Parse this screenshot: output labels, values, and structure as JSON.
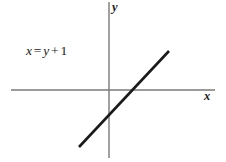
{
  "figure": {
    "type": "line-graph",
    "background_color": "#ffffff",
    "equation_label": {
      "full_text": "x = y + 1",
      "lhs": "x",
      "equals": "=",
      "rhs_var": "y",
      "plus": "+",
      "constant": "1"
    },
    "axes": {
      "x_label": "x",
      "y_label": "y",
      "axis_color": "#7a7a7a"
    },
    "line": {
      "color": "#1a1a1a"
    }
  },
  "chart_data": {
    "type": "line",
    "title": "",
    "subtitle": "",
    "xlabel": "x",
    "ylabel": "y",
    "annotations": [
      "x = y + 1"
    ],
    "legend": [],
    "grid": false,
    "axis_origin_px": {
      "x": 109,
      "y": 90
    },
    "xlim": [
      -4.9,
      5.3
    ],
    "ylim": [
      -3.4,
      4.4
    ],
    "series": [
      {
        "name": "x = y + 1",
        "equation": "x = y + 1",
        "slope": 1,
        "y_intercept": -1,
        "x_intercept": 1,
        "points": [
          {
            "x": -1.5,
            "y": -2.5
          },
          {
            "x": 3.0,
            "y": 2.0
          }
        ],
        "endpoints_px": [
          {
            "x": 79,
            "y": 147
          },
          {
            "x": 169,
            "y": 51
          }
        ],
        "color": "#1a1a1a",
        "width_px": 2.6
      }
    ],
    "x_axis_px": {
      "x1": 11,
      "y1": 90,
      "x2": 215,
      "y2": 90
    },
    "y_axis_px": {
      "x1": 109,
      "y1": 2,
      "x2": 109,
      "y2": 158
    }
  }
}
